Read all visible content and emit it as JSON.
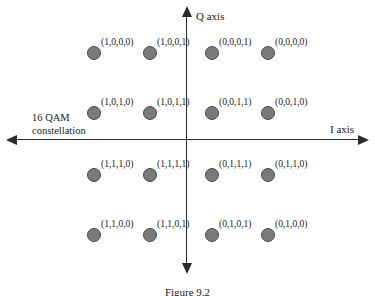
{
  "figure": {
    "caption": "Figure 9.2",
    "annotation_line1": "16 QAM",
    "annotation_line2": "constellation"
  },
  "axes": {
    "q_label": "Q axis",
    "i_label": "I axis"
  },
  "chart_data": {
    "type": "scatter",
    "title": "16 QAM constellation",
    "xlabel": "I axis",
    "ylabel": "Q axis",
    "grid": false,
    "legend": null,
    "xlim": [
      -4,
      4
    ],
    "ylim": [
      -4,
      4
    ],
    "xticklabels": [],
    "yticklabels": [],
    "marker": {
      "shape": "circle",
      "fill": "#7a7a7a",
      "edge": "#4a4a4a",
      "size_px": 14
    },
    "points": [
      {
        "label": "(1,0,0,0)",
        "x": -3,
        "y": 3,
        "px": 94,
        "py": 53
      },
      {
        "label": "(1,0,0,1)",
        "x": -1,
        "y": 3,
        "px": 150,
        "py": 53
      },
      {
        "label": "(0,0,0,1)",
        "x": 1,
        "y": 3,
        "px": 212,
        "py": 53
      },
      {
        "label": "(0,0,0,0)",
        "x": 3,
        "y": 3,
        "px": 268,
        "py": 53
      },
      {
        "label": "(1,0,1,0)",
        "x": -3,
        "y": 1,
        "px": 94,
        "py": 113
      },
      {
        "label": "(1,0,1,1)",
        "x": -1,
        "y": 1,
        "px": 150,
        "py": 113
      },
      {
        "label": "(0,0,1,1)",
        "x": 1,
        "y": 1,
        "px": 212,
        "py": 113
      },
      {
        "label": "(0,0,1,0)",
        "x": 3,
        "y": 1,
        "px": 268,
        "py": 113
      },
      {
        "label": "(1,1,1,0)",
        "x": -3,
        "y": -1,
        "px": 94,
        "py": 175
      },
      {
        "label": "(1,1,1,1)",
        "x": -1,
        "y": -1,
        "px": 150,
        "py": 175
      },
      {
        "label": "(0,1,1,1)",
        "x": 1,
        "y": -1,
        "px": 212,
        "py": 175
      },
      {
        "label": "(0,1,1,0)",
        "x": 3,
        "y": -1,
        "px": 268,
        "py": 175
      },
      {
        "label": "(1,1,0,0)",
        "x": -3,
        "y": -3,
        "px": 94,
        "py": 235
      },
      {
        "label": "(1,1,0,1)",
        "x": -1,
        "y": -3,
        "px": 150,
        "py": 235
      },
      {
        "label": "(0,1,0,1)",
        "x": 1,
        "y": -3,
        "px": 212,
        "py": 235
      },
      {
        "label": "(0,1,0,0)",
        "x": 3,
        "y": -3,
        "px": 268,
        "py": 235
      }
    ]
  }
}
